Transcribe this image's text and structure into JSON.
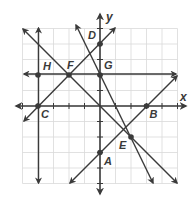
{
  "diagram": {
    "axes": {
      "x_label": "x",
      "y_label": "y",
      "range": [
        -5,
        5
      ],
      "unit_px": 15.5,
      "origin_px": [
        100,
        106
      ]
    },
    "colors": {
      "grid": "#d9d9d9",
      "line": "#3a3a3a",
      "background": "#ffffff"
    },
    "points": [
      {
        "name": "A",
        "x": 0,
        "y": -3
      },
      {
        "name": "B",
        "x": 3,
        "y": 0
      },
      {
        "name": "C",
        "x": -4,
        "y": 0
      },
      {
        "name": "D",
        "x": 0,
        "y": 4
      },
      {
        "name": "E",
        "x": 2,
        "y": -2
      },
      {
        "name": "F",
        "x": -2,
        "y": 2
      },
      {
        "name": "G",
        "x": 0,
        "y": 2
      },
      {
        "name": "H",
        "x": -4,
        "y": 2
      }
    ],
    "lines": [
      {
        "equation": "x = -4",
        "through": [
          "H",
          "C"
        ]
      },
      {
        "equation": "y = 2",
        "through": [
          "H",
          "F",
          "G"
        ]
      },
      {
        "equation": "y = x + 4",
        "through": [
          "C",
          "F",
          "D"
        ]
      },
      {
        "equation": "y = -x",
        "through": [
          "F",
          "E"
        ]
      },
      {
        "equation": "y = -2x + 2",
        "through": [
          "G",
          "E"
        ]
      },
      {
        "equation": "y = x - 3",
        "through": [
          "A",
          "B"
        ]
      }
    ]
  }
}
